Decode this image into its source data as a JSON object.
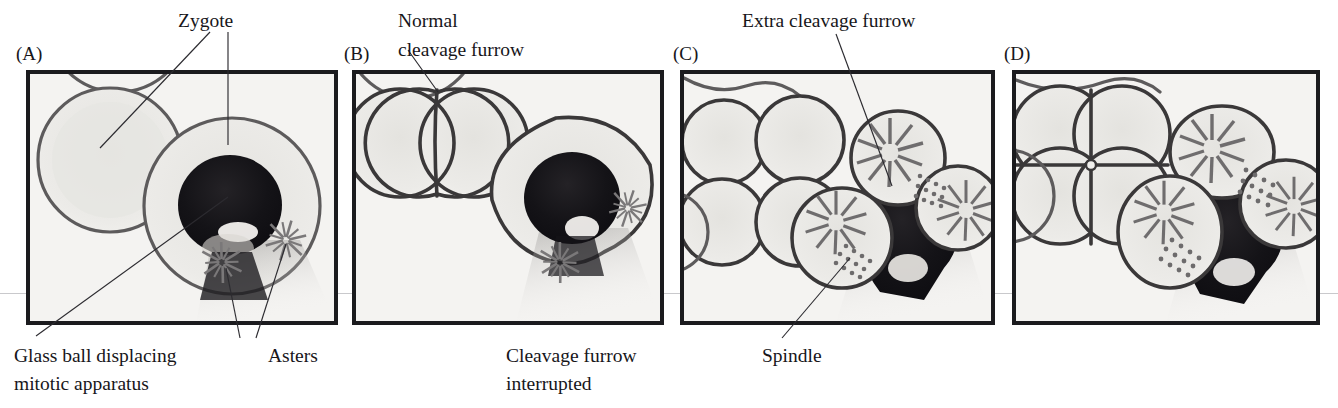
{
  "figure": {
    "background_color": "#ffffff",
    "panel_fill_color": "#f4f3f1",
    "frame_color": "#1b1b1e",
    "text_color": "#17161a",
    "scanline_color": "#c9c9cc"
  },
  "panels": [
    {
      "id": "A",
      "letter": "(A)",
      "top_labels": [
        {
          "name": "zygote-label-left",
          "text": "Zygote"
        }
      ],
      "bottom_labels": [
        {
          "name": "glass-ball-caption",
          "line1": "Glass ball displacing",
          "line2": "mitotic apparatus"
        },
        {
          "name": "asters-caption",
          "line1": "Asters",
          "line2": ""
        }
      ],
      "description": "Two round zygotes; the right one contains a dark glass ball with two asters beneath it"
    },
    {
      "id": "B",
      "letter": "(B)",
      "top_labels": [
        {
          "name": "normal-cleavage-furrow-label",
          "line1": "Normal",
          "line2": "cleavage furrow"
        }
      ],
      "bottom_labels": [
        {
          "name": "cleavage-furrow-interrupted-caption",
          "line1": "Cleavage furrow",
          "line2": "interrupted"
        }
      ],
      "description": "Left cell divided normally into two; right cell furrow interrupted by glass ball, two asters visible"
    },
    {
      "id": "C",
      "letter": "(C)",
      "top_labels": [
        {
          "name": "extra-cleavage-furrow-label",
          "text": "Extra cleavage furrow"
        }
      ],
      "bottom_labels": [
        {
          "name": "spindle-caption",
          "line1": "Spindle",
          "line2": ""
        }
      ],
      "description": "Left embryo at four-cell stage; right embryo with three aster-bearing blastomeres around the glass ball and spindles between them"
    },
    {
      "id": "D",
      "letter": "(D)",
      "top_labels": [],
      "bottom_labels": [],
      "description": "Left embryo four-cell stage; right embryo with three large aster-bearing cells and dotted spindles around the displaced glass ball"
    }
  ],
  "annotations": {
    "zygote": "Zygote",
    "normal_cleavage_furrow_l1": "Normal",
    "normal_cleavage_furrow_l2": "cleavage furrow",
    "extra_cleavage_furrow": "Extra cleavage furrow",
    "glass_ball_l1": "Glass ball displacing",
    "glass_ball_l2": "mitotic apparatus",
    "asters": "Asters",
    "cleavage_furrow_interrupted_l1": "Cleavage furrow",
    "cleavage_furrow_interrupted_l2": "interrupted",
    "spindle": "Spindle",
    "letter_a": "(A)",
    "letter_b": "(B)",
    "letter_c": "(C)",
    "letter_d": "(D)"
  }
}
